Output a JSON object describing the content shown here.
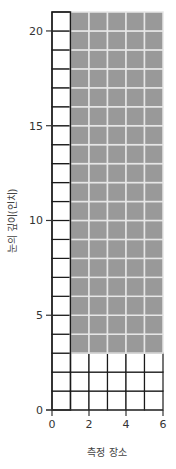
{
  "chart_data": {
    "type": "heatmap",
    "title": "",
    "xlabel": "측정 장소",
    "ylabel": "눈의 깊이(인치)",
    "xlim": [
      0,
      6
    ],
    "ylim": [
      0,
      21
    ],
    "x_ticks": [
      0,
      2,
      4,
      6
    ],
    "y_ticks": [
      0,
      5,
      10,
      15,
      20
    ],
    "grid": true,
    "grid_cell_size": 1,
    "regions": [
      {
        "name": "unshaded-column",
        "x": [
          0,
          1
        ],
        "y": [
          0,
          21
        ],
        "fill": "#ffffff"
      },
      {
        "name": "unshaded-base",
        "x": [
          1,
          6
        ],
        "y": [
          0,
          3
        ],
        "fill": "#ffffff"
      },
      {
        "name": "shaded-block",
        "x": [
          1,
          6
        ],
        "y": [
          3,
          21
        ],
        "fill": "#999999"
      }
    ],
    "colors": {
      "shaded": "#999999",
      "shaded_gridline": "#e6e6e6",
      "gridline": "#1a1a1a",
      "axis": "#333333"
    }
  }
}
